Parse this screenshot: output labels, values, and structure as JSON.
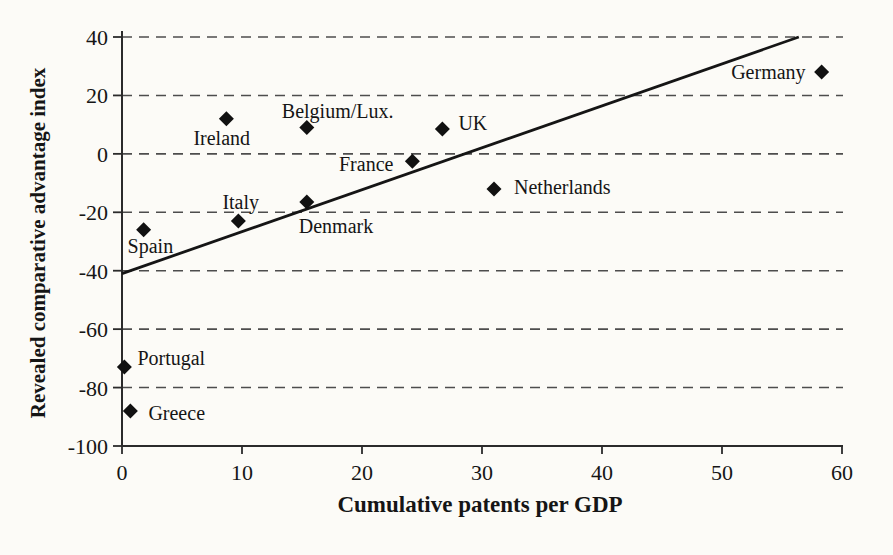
{
  "chart_data": {
    "type": "scatter",
    "title": "",
    "xlabel": "Cumulative patents per GDP",
    "ylabel": "Revealed comparative advantage index",
    "xlim": [
      0,
      60
    ],
    "ylim": [
      -100,
      40
    ],
    "x_ticks": [
      0,
      10,
      20,
      30,
      40,
      50,
      60
    ],
    "y_ticks": [
      40,
      20,
      0,
      -20,
      -40,
      -60,
      -80,
      -100
    ],
    "gridlines": {
      "axis": "y",
      "style": "dashed",
      "values": [
        40,
        20,
        0,
        -20,
        -40,
        -60,
        -80
      ]
    },
    "legend": "none",
    "marker": "diamond",
    "series": [
      {
        "name": "EU countries",
        "color": "#111111",
        "points": [
          {
            "label": "Spain",
            "x": 1.8,
            "y": -26,
            "label_dx": -16,
            "label_dy": 23,
            "label_anchor": "start"
          },
          {
            "label": "Portugal",
            "x": 0.2,
            "y": -73,
            "label_dx": 13,
            "label_dy": -2,
            "label_anchor": "start"
          },
          {
            "label": "Greece",
            "x": 0.7,
            "y": -88,
            "label_dx": 18,
            "label_dy": 9,
            "label_anchor": "start"
          },
          {
            "label": "Ireland",
            "x": 8.7,
            "y": 12,
            "label_dx": -33,
            "label_dy": 26,
            "label_anchor": "start"
          },
          {
            "label": "Italy",
            "x": 9.7,
            "y": -23,
            "label_dx": -16,
            "label_dy": -12,
            "label_anchor": "start"
          },
          {
            "label": "Belgium/Lux.",
            "x": 15.4,
            "y": 9,
            "label_dx": -25,
            "label_dy": -10,
            "label_anchor": "start"
          },
          {
            "label": "Denmark",
            "x": 15.4,
            "y": -16.5,
            "label_dx": -8,
            "label_dy": 31,
            "label_anchor": "start"
          },
          {
            "label": "France",
            "x": 24.2,
            "y": -2.5,
            "label_dx": -19,
            "label_dy": 10,
            "label_anchor": "end"
          },
          {
            "label": "UK",
            "x": 26.7,
            "y": 8.5,
            "label_dx": 16,
            "label_dy": 1,
            "label_anchor": "start"
          },
          {
            "label": "Netherlands",
            "x": 31,
            "y": -12,
            "label_dx": 20,
            "label_dy": 5,
            "label_anchor": "start"
          },
          {
            "label": "Germany",
            "x": 58.3,
            "y": 28,
            "label_dx": -16,
            "label_dy": 7,
            "label_anchor": "end"
          }
        ]
      }
    ],
    "trendline": {
      "x1": 0,
      "y1": -41,
      "x2": 56.4,
      "y2": 40
    }
  },
  "colors": {
    "background": "#fcfbf7",
    "ink": "#111111",
    "grid": "#4d4d4d",
    "axis": "#2b2b2b",
    "trend": "#151515"
  }
}
